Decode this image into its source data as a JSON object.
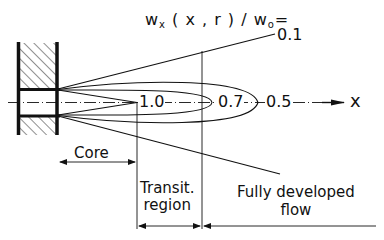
{
  "diagram": {
    "type": "free jet velocity contour schematic",
    "title": {
      "prefix": "w",
      "prefix_sub": "x",
      "args": " ( x , r ) / w",
      "denom_sub": "o",
      "suffix": "="
    },
    "contour_labels": {
      "outer": "0.1",
      "inner": "1.0",
      "middle": "0.7",
      "far": "0.5"
    },
    "axis_label": "x",
    "regions": {
      "core": "Core",
      "transition_line1": "Transit.",
      "transition_line2": "region",
      "developed_line1": "Fully developed",
      "developed_line2": "flow"
    },
    "colors": {
      "ink": "#111111",
      "background": "#ffffff"
    }
  }
}
